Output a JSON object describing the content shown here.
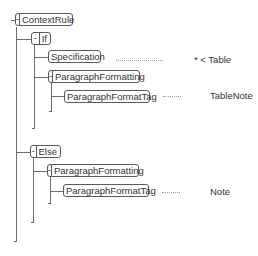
{
  "tree": {
    "root": {
      "label": "ContextRule",
      "toggle": "-",
      "children": {
        "if": {
          "label": "If",
          "toggle": "-",
          "specification": {
            "label": "Specification",
            "value": "* < Table"
          },
          "paragraph_formatting": {
            "label": "ParagraphFormatting",
            "toggle": "-",
            "paragraph_format_tag": {
              "label": "ParagraphFormatTag",
              "value": "TableNote"
            }
          }
        },
        "else": {
          "label": "Else",
          "toggle": "-",
          "paragraph_formatting": {
            "label": "ParagraphFormatting",
            "toggle": "-",
            "paragraph_format_tag": {
              "label": "ParagraphFormatTag",
              "value": "Note"
            }
          }
        }
      }
    }
  },
  "colors": {
    "border": "#5a5a5a",
    "line": "#6a6a6a",
    "text": "#333333"
  }
}
